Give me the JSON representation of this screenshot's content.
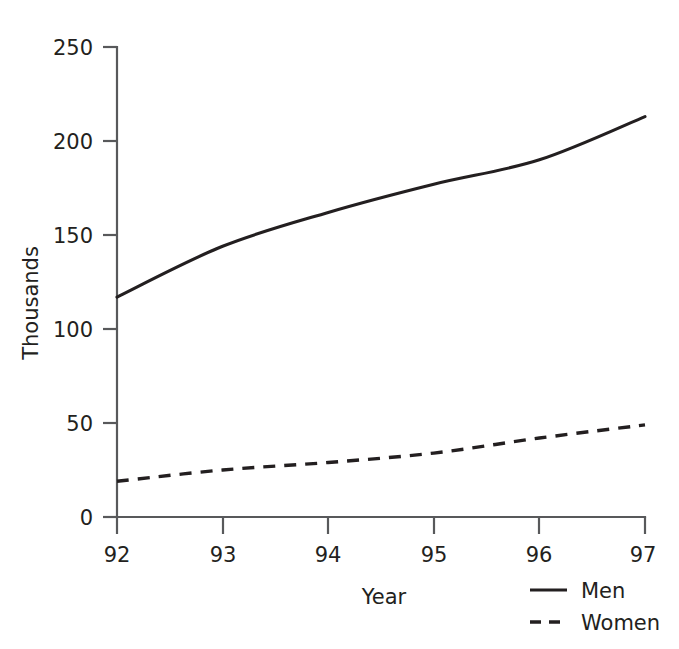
{
  "chart_data": {
    "type": "line",
    "title": "",
    "subtitle": "",
    "xlabel": "Year",
    "ylabel": "Thousands",
    "x": [
      "92",
      "93",
      "94",
      "95",
      "96",
      "97"
    ],
    "categories": [
      "92",
      "93",
      "94",
      "95",
      "96",
      "97"
    ],
    "series": [
      {
        "name": "Men",
        "style": "solid",
        "values": [
          117,
          144,
          162,
          177,
          190,
          213
        ]
      },
      {
        "name": "Women",
        "style": "dashed",
        "values": [
          19,
          25,
          29,
          34,
          42,
          49
        ]
      }
    ],
    "xlim": [
      92,
      97
    ],
    "ylim": [
      0,
      250
    ],
    "ytick_labels": [
      "0",
      "50",
      "100",
      "150",
      "200",
      "250"
    ],
    "ytick_values": [
      0,
      50,
      100,
      150,
      200,
      250
    ],
    "xtick_labels": [
      "92",
      "93",
      "94",
      "95",
      "96",
      "97"
    ],
    "grid": false,
    "legend_position": "bottom-right",
    "colors": {
      "line": "#231f20",
      "axis": "#58595b",
      "background": "#ffffff",
      "text": "#231f20"
    }
  },
  "axes": {
    "y_title": "Thousands",
    "x_title": "Year",
    "y_ticks": [
      {
        "label": "250"
      },
      {
        "label": "200"
      },
      {
        "label": "150"
      },
      {
        "label": "100"
      },
      {
        "label": "50"
      },
      {
        "label": "0"
      }
    ],
    "x_ticks": [
      {
        "label": "92"
      },
      {
        "label": "93"
      },
      {
        "label": "94"
      },
      {
        "label": "95"
      },
      {
        "label": "96"
      },
      {
        "label": "97"
      }
    ]
  },
  "legend": {
    "entries": [
      {
        "label": "Men",
        "style": "solid"
      },
      {
        "label": "Women",
        "style": "dashed"
      }
    ]
  }
}
